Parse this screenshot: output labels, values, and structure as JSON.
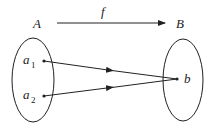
{
  "diagram": {
    "type": "mapping",
    "function_label": "f",
    "domain_set": {
      "label": "A",
      "elements": [
        {
          "base": "a",
          "sub": "1"
        },
        {
          "base": "a",
          "sub": "2"
        }
      ]
    },
    "codomain_set": {
      "label": "B",
      "elements": [
        {
          "base": "b",
          "sub": ""
        }
      ]
    },
    "mappings": [
      {
        "from": "a1",
        "to": "b"
      },
      {
        "from": "a2",
        "to": "b"
      }
    ],
    "colors": {
      "stroke": "#222222",
      "background": "#ffffff"
    }
  }
}
